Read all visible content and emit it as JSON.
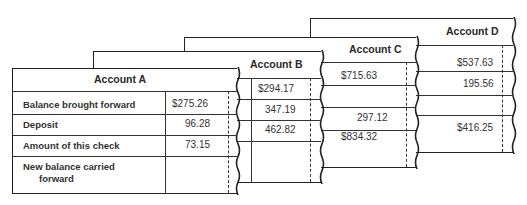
{
  "accounts": {
    "a": {
      "title": "Account A",
      "rows": [
        {
          "label": "Balance brought forward",
          "value": "$275.26"
        },
        {
          "label": "Deposit",
          "value": "96.28"
        },
        {
          "label": "Amount of this check",
          "value": "73.15"
        },
        {
          "label": "New balance carried",
          "label2": "forward",
          "value": ""
        }
      ]
    },
    "b": {
      "title": "Account B",
      "values": [
        "$294.17",
        "347.19",
        "462.82",
        ""
      ]
    },
    "c": {
      "title": "Account C",
      "values": [
        "$715.63",
        "",
        "297.12",
        "$834.32"
      ]
    },
    "d": {
      "title": "Account D",
      "values": [
        "$537.63",
        "195.56",
        "",
        "$416.25"
      ]
    }
  }
}
